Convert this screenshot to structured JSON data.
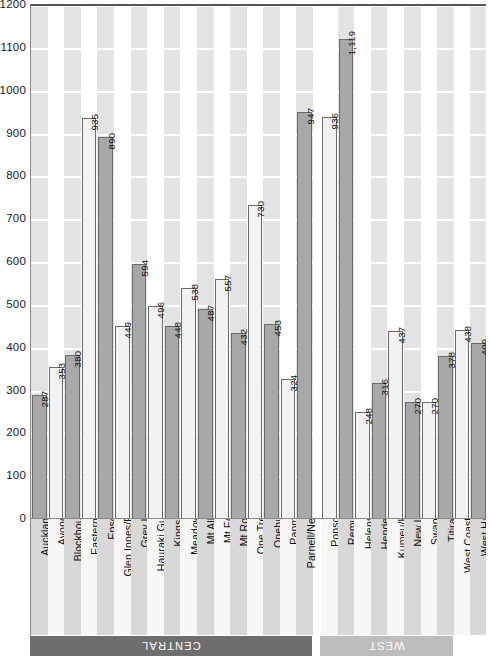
{
  "chart_data": {
    "type": "bar",
    "title": "",
    "xlabel": "",
    "ylabel": "",
    "ylim": [
      0,
      1200
    ],
    "ytick_step": 100,
    "yticks": [
      1200,
      1100,
      1000,
      900,
      800,
      700,
      600,
      500,
      400,
      300,
      200,
      100,
      0
    ],
    "grid": true,
    "legend": "none",
    "orientation": "vertical",
    "value_labels": true,
    "groups": [
      {
        "name": "CENTRAL",
        "color": "#6e6e6e",
        "count": 17
      },
      {
        "name": "WEST",
        "color": "#bdbdbd",
        "count": 8
      }
    ],
    "categories": [
      "Auckland City",
      "Avondale",
      "Blockhouse Bay",
      "Eastern Bays",
      "Epsom",
      "Glen Innes/Pt England",
      "Grey Lynn",
      "Hauraki Gulf Islands",
      "Kingsland",
      "Meadowbank",
      "Mt Albert",
      "Mt Eden",
      "Mt Roskill",
      "One Tree Hill",
      "Onehunga",
      "Panmure",
      "Parnell/Newmarket",
      "Ponsonby",
      "Remuera",
      "Helensville",
      "Henderson",
      "Kumeu/Huapai",
      "New Lynn",
      "Swanson",
      "Titirangi",
      "West Coast Beaches",
      "West Harbour"
    ],
    "values": [
      287,
      353,
      380,
      935,
      890,
      449,
      594,
      496,
      448,
      538,
      487,
      557,
      432,
      730,
      453,
      324,
      947,
      936,
      1119,
      248,
      316,
      437,
      270,
      270,
      378,
      438,
      409
    ],
    "value_label_text": [
      "287",
      "353",
      "380",
      "935",
      "890",
      "449",
      "594",
      "496",
      "448",
      "538",
      "487",
      "557",
      "432",
      "730",
      "453",
      "324",
      "947",
      "936",
      "1,119",
      "248",
      "316",
      "437",
      "270",
      "270",
      "378",
      "438",
      "409"
    ],
    "bar_group_index": [
      0,
      0,
      0,
      0,
      0,
      0,
      0,
      0,
      0,
      0,
      0,
      0,
      0,
      0,
      0,
      0,
      0,
      0,
      0,
      1,
      1,
      1,
      1,
      1,
      1,
      1,
      1
    ],
    "bar_fill_alternating": [
      "#a8a8a8",
      "#f2f2f2"
    ],
    "bar_stroke": "#6b6b6b",
    "plot_band_color": "#e3e3e3",
    "plot_background": "#ffffff"
  }
}
